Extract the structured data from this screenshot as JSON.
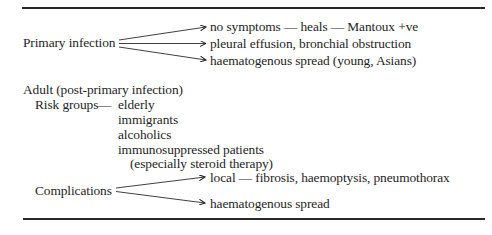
{
  "diagram": {
    "primary": {
      "label": "Primary infection",
      "branches": [
        "no symptoms — heals — Mantoux +ve",
        "pleural effusion, bronchial obstruction",
        "haematogenous spread (young, Asians)"
      ]
    },
    "adult": {
      "heading": "Adult (post-primary infection)",
      "risk_groups": {
        "label": "Risk groups",
        "dash": "—",
        "items": [
          "elderly",
          "immigrants",
          "alcoholics",
          "immunosuppressed patients",
          "(especially steroid therapy)"
        ]
      },
      "complications": {
        "label": "Complications",
        "branches": [
          "local — fibrosis, haemoptysis, pneumothorax",
          "haematogenous spread"
        ]
      }
    }
  }
}
